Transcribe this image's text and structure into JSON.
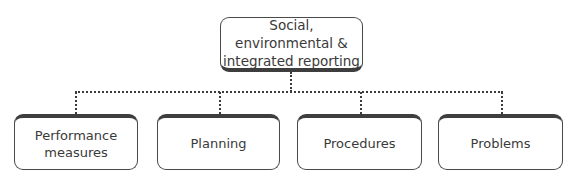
{
  "diagram": {
    "root": {
      "label": "Social, environmental & integrated reporting"
    },
    "children": [
      {
        "label": "Performance measures"
      },
      {
        "label": "Planning"
      },
      {
        "label": "Procedures"
      },
      {
        "label": "Problems"
      }
    ]
  }
}
